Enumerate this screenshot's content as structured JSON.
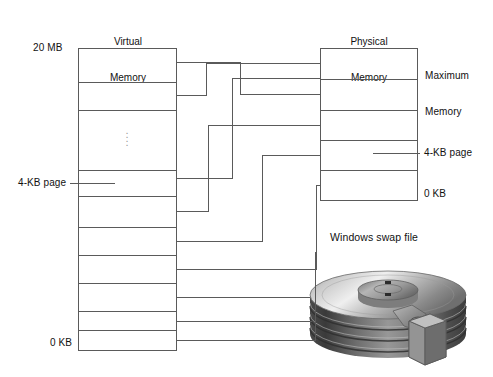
{
  "diagram": {
    "type": "memory-paging-diagram",
    "virtual_memory": {
      "title_line1": "Virtual",
      "title_line2": "Memory",
      "top_label": "20 MB",
      "bottom_label": "0 KB",
      "page_label": "4-KB page",
      "ellipsis": "⋮",
      "row_count": 10,
      "box": {
        "x": 78,
        "y": 48,
        "w": 98,
        "h": 302
      },
      "row_boundaries_y": [
        48,
        82,
        110,
        170,
        196,
        227,
        255,
        283,
        311,
        330,
        350
      ]
    },
    "physical_memory": {
      "title_line1": "Physical",
      "title_line2": "Memory",
      "top_label_line1": "Maximum",
      "top_label_line2": "Memory",
      "page_label": "4-KB page",
      "bottom_label": "0 KB",
      "row_count": 5,
      "box": {
        "x": 320,
        "y": 48,
        "w": 97,
        "h": 152
      },
      "row_boundaries_y": [
        48,
        79,
        110,
        140,
        170,
        200
      ]
    },
    "swap_file": {
      "title": "Windows swap file",
      "icon": "hard-disk-platter-stack"
    },
    "connections": [
      {
        "from_vm_row": 0,
        "to": "pm_row_1"
      },
      {
        "from_vm_row": 1,
        "to": "pm_row_0"
      },
      {
        "from_vm_row": 3,
        "to": "pm_row_3"
      },
      {
        "from_vm_row": 4,
        "to": "pm_row_4"
      },
      {
        "from_vm_row": 5,
        "to": "pm_row_2"
      },
      {
        "from_vm_row": 6,
        "to": "swap_file"
      },
      {
        "from_vm_row": 7,
        "to": "swap_file"
      },
      {
        "from_vm_row": 8,
        "to": "swap_file"
      }
    ]
  },
  "colors": {
    "line": "#5a5a5a",
    "text": "#111111",
    "background": "#ffffff",
    "dots": "#9a9a9a"
  }
}
